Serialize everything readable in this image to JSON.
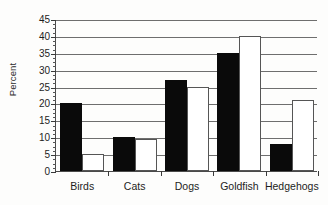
{
  "chart_data": {
    "type": "bar",
    "title": "",
    "xlabel": "",
    "ylabel": "Percent",
    "ylim": [
      0,
      45
    ],
    "ytick_step": 5,
    "yticks": [
      0,
      5,
      10,
      15,
      20,
      25,
      30,
      35,
      40,
      45
    ],
    "ytick_labels": [
      "0",
      "5",
      "10",
      "15",
      "20",
      "25",
      "30",
      "35",
      "40",
      "45"
    ],
    "minor_tick_step": 1.25,
    "grid": true,
    "grid_axis": "y",
    "legend": false,
    "legend_position": "none",
    "categories": [
      "Birds",
      "Cats",
      "Dogs",
      "Goldfish",
      "Hedgehogs"
    ],
    "series": [
      {
        "name": "Series 1",
        "color": "#0a0a0a",
        "fill": "black",
        "values": [
          20,
          10,
          27,
          35,
          8
        ]
      },
      {
        "name": "Series 2",
        "color": "#ffffff",
        "fill": "white",
        "edge_color": "#555555",
        "values": [
          5,
          9.5,
          25,
          40,
          21
        ]
      }
    ]
  },
  "colors": {
    "background": "#fdfdfc",
    "axis": "#3a3a3a",
    "gridline": "#6e6e6e",
    "text": "#1d1d1d",
    "bar_black": "#0a0a0a",
    "bar_white": "#ffffff",
    "bar_white_edge": "#555555"
  }
}
